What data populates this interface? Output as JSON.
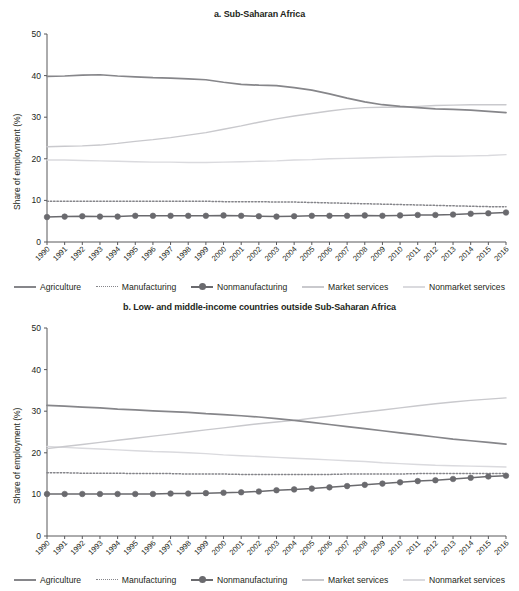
{
  "figure": {
    "ylabel": "Share of employment (%)",
    "yticks": [
      0,
      10,
      20,
      30,
      40,
      50
    ],
    "years": [
      1990,
      1991,
      1992,
      1993,
      1994,
      1995,
      1996,
      1997,
      1998,
      1999,
      2000,
      2001,
      2002,
      2003,
      2004,
      2005,
      2006,
      2007,
      2008,
      2009,
      2010,
      2011,
      2012,
      2013,
      2014,
      2015,
      2016
    ]
  },
  "colors": {
    "agriculture": "#86868a",
    "manufacturing": "#85858a",
    "nonmanufacturing": "#6a6a6e",
    "market_services": "#c9c9cd",
    "nonmarket_services": "#dadade",
    "axis": "#58585b",
    "text": "#231f20"
  },
  "legend": {
    "items": [
      {
        "label": "Agriculture",
        "style": "solid",
        "key": "agriculture"
      },
      {
        "label": "Manufacturing",
        "style": "dotted",
        "key": "manufacturing"
      },
      {
        "label": "Nonmanufacturing",
        "style": "solid-marker",
        "key": "nonmanufacturing"
      },
      {
        "label": "Market services",
        "style": "solid",
        "key": "market_services"
      },
      {
        "label": "Nonmarket services",
        "style": "solid",
        "key": "nonmarket_services"
      }
    ]
  },
  "chart_data": [
    {
      "type": "line",
      "panel": "a",
      "title": "a. Sub-Saharan Africa",
      "xlabel": "",
      "ylabel": "Share of employment (%)",
      "ylim": [
        0,
        50
      ],
      "grid": false,
      "legend_position": "bottom",
      "x": [
        1990,
        1991,
        1992,
        1993,
        1994,
        1995,
        1996,
        1997,
        1998,
        1999,
        2000,
        2001,
        2002,
        2003,
        2004,
        2005,
        2006,
        2007,
        2008,
        2009,
        2010,
        2011,
        2012,
        2013,
        2014,
        2015,
        2016
      ],
      "series": [
        {
          "name": "Agriculture",
          "values": [
            39.8,
            39.9,
            40.1,
            40.2,
            39.9,
            39.7,
            39.5,
            39.4,
            39.2,
            39.0,
            38.4,
            37.9,
            37.7,
            37.6,
            37.1,
            36.5,
            35.6,
            34.6,
            33.7,
            33.0,
            32.6,
            32.3,
            32.0,
            31.9,
            31.7,
            31.4,
            31.1
          ]
        },
        {
          "name": "Manufacturing",
          "values": [
            9.8,
            9.8,
            9.8,
            9.8,
            9.8,
            9.8,
            9.8,
            9.8,
            9.8,
            9.8,
            9.7,
            9.7,
            9.7,
            9.6,
            9.6,
            9.5,
            9.4,
            9.3,
            9.2,
            9.1,
            9.0,
            8.9,
            8.8,
            8.7,
            8.6,
            8.5,
            8.5
          ]
        },
        {
          "name": "Nonmanufacturing",
          "values": [
            6.0,
            6.1,
            6.2,
            6.1,
            6.1,
            6.3,
            6.3,
            6.3,
            6.3,
            6.3,
            6.4,
            6.3,
            6.2,
            6.1,
            6.2,
            6.3,
            6.3,
            6.3,
            6.4,
            6.3,
            6.4,
            6.5,
            6.5,
            6.6,
            6.8,
            6.9,
            7.1
          ]
        },
        {
          "name": "Market services",
          "values": [
            22.9,
            23.0,
            23.1,
            23.3,
            23.7,
            24.2,
            24.6,
            25.1,
            25.7,
            26.3,
            27.1,
            27.9,
            28.8,
            29.6,
            30.3,
            30.9,
            31.5,
            32.0,
            32.3,
            32.4,
            32.4,
            32.6,
            32.8,
            32.9,
            33.0,
            33.0,
            33.0
          ]
        },
        {
          "name": "Nonmarket services",
          "values": [
            19.7,
            19.7,
            19.6,
            19.5,
            19.4,
            19.3,
            19.2,
            19.2,
            19.1,
            19.1,
            19.2,
            19.3,
            19.4,
            19.5,
            19.7,
            19.8,
            20.0,
            20.1,
            20.2,
            20.3,
            20.4,
            20.5,
            20.6,
            20.6,
            20.7,
            20.8,
            21.0
          ]
        }
      ]
    },
    {
      "type": "line",
      "panel": "b",
      "title": "b. Low- and middle-income countries outside Sub-Saharan Africa",
      "xlabel": "",
      "ylabel": "Share of employment (%)",
      "ylim": [
        0,
        50
      ],
      "grid": false,
      "legend_position": "bottom",
      "x": [
        1990,
        1991,
        1992,
        1993,
        1994,
        1995,
        1996,
        1997,
        1998,
        1999,
        2000,
        2001,
        2002,
        2003,
        2004,
        2005,
        2006,
        2007,
        2008,
        2009,
        2010,
        2011,
        2012,
        2013,
        2014,
        2015,
        2016
      ],
      "series": [
        {
          "name": "Agriculture",
          "values": [
            31.4,
            31.2,
            31.0,
            30.8,
            30.5,
            30.3,
            30.1,
            29.9,
            29.7,
            29.4,
            29.2,
            28.9,
            28.6,
            28.2,
            27.8,
            27.3,
            26.8,
            26.3,
            25.8,
            25.3,
            24.8,
            24.3,
            23.8,
            23.3,
            22.9,
            22.5,
            22.1
          ]
        },
        {
          "name": "Manufacturing",
          "values": [
            15.2,
            15.2,
            15.1,
            15.1,
            15.1,
            15.0,
            15.0,
            15.0,
            14.9,
            14.9,
            14.9,
            14.8,
            14.8,
            14.8,
            14.8,
            14.8,
            14.8,
            14.9,
            14.9,
            14.9,
            14.9,
            15.0,
            15.0,
            15.0,
            15.0,
            15.0,
            15.0
          ]
        },
        {
          "name": "Nonmanufacturing",
          "values": [
            10.1,
            10.1,
            10.1,
            10.1,
            10.1,
            10.1,
            10.1,
            10.2,
            10.2,
            10.3,
            10.4,
            10.5,
            10.7,
            11.0,
            11.2,
            11.4,
            11.7,
            12.0,
            12.3,
            12.6,
            12.9,
            13.2,
            13.4,
            13.7,
            14.0,
            14.3,
            14.5
          ]
        },
        {
          "name": "Market services",
          "values": [
            21.0,
            21.5,
            22.0,
            22.5,
            23.0,
            23.5,
            24.0,
            24.5,
            25.0,
            25.5,
            26.0,
            26.5,
            27.0,
            27.4,
            27.8,
            28.3,
            28.8,
            29.3,
            29.8,
            30.3,
            30.8,
            31.3,
            31.8,
            32.2,
            32.6,
            32.9,
            33.2
          ]
        },
        {
          "name": "Nonmarket services",
          "values": [
            21.5,
            21.3,
            21.1,
            20.9,
            20.7,
            20.5,
            20.3,
            20.2,
            20.0,
            19.8,
            19.5,
            19.3,
            19.1,
            18.9,
            18.7,
            18.5,
            18.3,
            18.1,
            17.9,
            17.6,
            17.4,
            17.2,
            17.0,
            16.9,
            16.8,
            16.7,
            16.6
          ]
        }
      ]
    }
  ]
}
